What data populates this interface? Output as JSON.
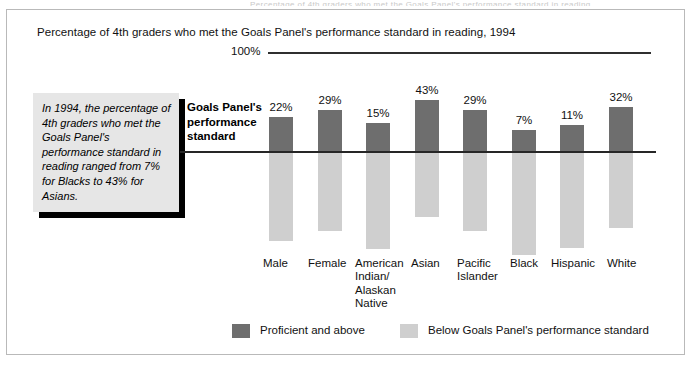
{
  "page": {
    "cutoff_header": "Percentage of 4th graders who met the Goals Panel's performance standard in reading",
    "title": "Percentage of 4th graders who met the Goals Panel's performance standard in reading, 1994"
  },
  "axis": {
    "top_label": "100%",
    "standard_label": "Goals Panel's\nperformance\nstandard"
  },
  "callout": {
    "text": "In 1994, the percentage of 4th graders who met the Goals Panel's performance standard in reading ranged from 7% for Blacks to 43% for Asians."
  },
  "legend": {
    "items": [
      {
        "label": "Proficient and above",
        "color": "#6e6e6e",
        "left": 0,
        "text_left": 28
      },
      {
        "label": "Below Goals Panel's performance standard",
        "color": "#cfcfcf",
        "left": 168,
        "text_left": 196
      }
    ]
  },
  "colors": {
    "proficient": "#6e6e6e",
    "below_standard": "#cfcfcf",
    "axis_line": "#2f2f2f",
    "standard_line": "#262626",
    "callout_fill": "#e6e6e6",
    "callout_shadow": "#000000",
    "frame_border": "#b9b9b9"
  },
  "chart_data": {
    "type": "bar",
    "title": "Percentage of 4th graders who met the Goals Panel's performance standard in reading, 1994",
    "xlabel": "",
    "ylabel": "",
    "ylim": [
      0,
      100
    ],
    "grid": false,
    "legend_position": "bottom",
    "stacked": true,
    "categories": [
      "Male",
      "Female",
      "American\nIndian/\nAlaskan\nNative",
      "Asian",
      "Pacific\nIslander",
      "Black",
      "Hispanic",
      "White"
    ],
    "series": [
      {
        "name": "Proficient and above",
        "color": "#6e6e6e",
        "values": [
          22,
          29,
          15,
          43,
          29,
          7,
          11,
          32
        ],
        "labels": [
          "22%",
          "29%",
          "15%",
          "43%",
          "29%",
          "7%",
          "11%",
          "32%"
        ]
      },
      {
        "name": "Below Goals Panel's performance standard",
        "color": "#cfcfcf",
        "values": [
          78,
          71,
          85,
          57,
          71,
          93,
          89,
          68
        ],
        "labels": []
      }
    ],
    "annotations": [
      "100%",
      "Goals Panel's performance standard"
    ]
  },
  "geometry": {
    "bar_width": 24,
    "bar_step": 48.5,
    "bar_first_left": 269,
    "standard_line_y": 151,
    "dark_tops": [
      117,
      110,
      123,
      100,
      110,
      130,
      125,
      107
    ],
    "light_bottoms": [
      241,
      231,
      249,
      217,
      231,
      255,
      248,
      228
    ],
    "label_tops": [
      101,
      94,
      107,
      84,
      94,
      114,
      109,
      91
    ],
    "cat_label_positions": [
      {
        "left": 263,
        "top": 257,
        "width": 44,
        "text": "Male"
      },
      {
        "left": 308,
        "top": 257,
        "width": 52,
        "text": "Female"
      },
      {
        "left": 355,
        "top": 257,
        "width": 54,
        "text": "American\nIndian/\nAlaskan\nNative"
      },
      {
        "left": 411,
        "top": 257,
        "width": 42,
        "text": "Asian"
      },
      {
        "left": 457,
        "top": 257,
        "width": 48,
        "text": "Pacific\nIslander"
      },
      {
        "left": 510,
        "top": 257,
        "width": 44,
        "text": "Black"
      },
      {
        "left": 551,
        "top": 257,
        "width": 56,
        "text": "Hispanic"
      },
      {
        "left": 607,
        "top": 257,
        "width": 44,
        "text": "White"
      }
    ]
  }
}
